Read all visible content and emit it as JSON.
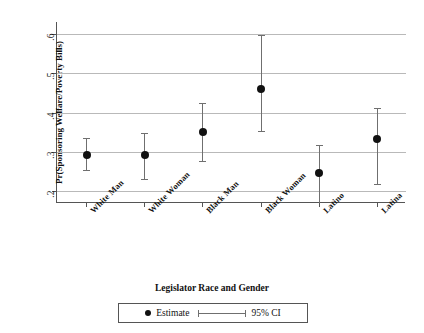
{
  "chart_data": {
    "type": "scatter",
    "title": "",
    "xlabel": "Legislator Race and Gender",
    "ylabel": "Pr(Sponsoring Welfare/Poverty Bills)",
    "categories": [
      "White Man",
      "White Woman",
      "Black Man",
      "Black Woman",
      "Latino",
      "Latina"
    ],
    "values": [
      0.292,
      0.292,
      0.35,
      0.46,
      0.245,
      0.332
    ],
    "ci_low": [
      0.253,
      0.231,
      0.277,
      0.353,
      0.17,
      0.218
    ],
    "ci_high": [
      0.334,
      0.349,
      0.425,
      0.597,
      0.317,
      0.412
    ],
    "ylim": [
      0.17,
      0.63
    ],
    "yticks": [
      0.2,
      0.3,
      0.4,
      0.5,
      0.6
    ],
    "ytick_labels": [
      ".2",
      ".3",
      ".4",
      ".5",
      ".6"
    ],
    "grid": true,
    "legend_position": "bottom",
    "series": [
      {
        "name": "Estimate",
        "marker": "circle",
        "color": "#111111"
      },
      {
        "name": "95% CI",
        "marker": "errorbar",
        "color": "#6f6f6f"
      }
    ]
  },
  "legend": {
    "estimate_label": "Estimate",
    "ci_label": "95% CI"
  },
  "colors": {
    "point": "#111111",
    "ci": "#6f6f6f",
    "grid": "#b9b9b9",
    "axis": "#555555",
    "background": "#ffffff"
  }
}
